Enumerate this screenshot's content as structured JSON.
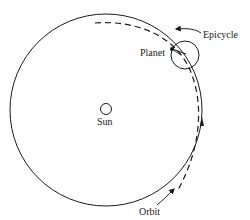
{
  "diagram": {
    "labels": {
      "sun": "Sun",
      "planet": "Planet",
      "epicycle": "Epicycle",
      "orbit": "Orbit"
    },
    "colors": {
      "stroke": "#1a1a1a",
      "background": "#ffffff"
    }
  }
}
